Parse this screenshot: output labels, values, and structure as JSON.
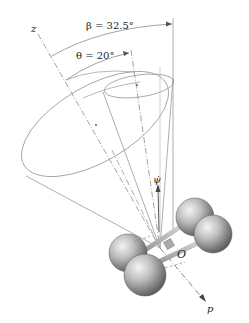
{
  "diagram": {
    "labels": {
      "z_axis": "z",
      "beta": "β = 32.5°",
      "theta": "θ = 20°",
      "psi_dot": "ψ̇",
      "origin": "O",
      "p_axis": "p"
    },
    "angles": {
      "beta_deg": 32.5,
      "theta_deg": 20
    },
    "colors": {
      "line": "#9a9a9a",
      "dash_line": "#8a8a8a",
      "text": "#222222",
      "sphere_light": "#f2f2f2",
      "sphere_dark": "#6e6e6e",
      "rod": "#b8b8b8"
    },
    "elements": {
      "outer_cone": "Space cone (large ellipse)",
      "inner_cone": "Body cone (small ellipse)",
      "molecule": "Four-sphere rotor centered at O"
    }
  }
}
